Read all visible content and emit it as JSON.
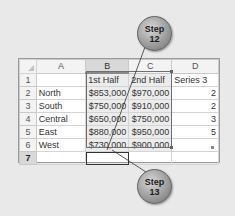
{
  "spreadsheet": {
    "column_headers": [
      "A",
      "B",
      "C",
      "D"
    ],
    "selected_column": "B",
    "row_numbers": [
      "1",
      "2",
      "3",
      "4",
      "5",
      "6",
      "7"
    ],
    "active_row": "7",
    "header_row": [
      "",
      "1st Half",
      "2nd Half",
      "Series 3"
    ],
    "rows": [
      {
        "label": "North",
        "b": "$853,000",
        "c": "$970,000",
        "d": "2"
      },
      {
        "label": "South",
        "b": "$750,000",
        "c": "$910,000",
        "d": "2"
      },
      {
        "label": "Central",
        "b": "$650,000",
        "c": "$750,000",
        "d": "3"
      },
      {
        "label": "East",
        "b": "$880,000",
        "c": "$950,000",
        "d": "5"
      },
      {
        "label": "West",
        "b": "$730,000",
        "c": "$900,000",
        "d": ""
      }
    ],
    "active_cell": "B7"
  },
  "callouts": [
    {
      "line1": "Step",
      "line2": "12"
    },
    {
      "line1": "Step",
      "line2": "13"
    }
  ],
  "colors": {
    "background": "#e9e9e9",
    "grid_line": "#d4d4d4",
    "header_bg": "#f3f3f3",
    "selected_header_bg": "#d8d8d8",
    "callout": "#9e9e9e"
  }
}
